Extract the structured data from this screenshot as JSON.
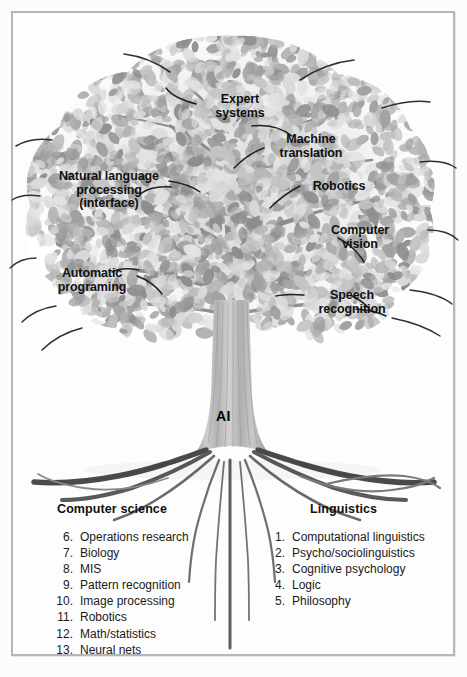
{
  "figure": {
    "title_root": "AI",
    "canopy_labels": [
      {
        "id": "expert-systems",
        "text": "Expert\nsystems",
        "x": 196,
        "y": 93,
        "w": 88,
        "align": "center"
      },
      {
        "id": "machine-translation",
        "text": "Machine\ntranslation",
        "x": 262,
        "y": 133,
        "w": 98,
        "align": "center"
      },
      {
        "id": "natural-language",
        "text": "Natural language\nprocessing\n(interface)",
        "x": 50,
        "y": 170,
        "w": 118,
        "align": "center"
      },
      {
        "id": "robotics",
        "text": "Robotics",
        "x": 306,
        "y": 180,
        "w": 66,
        "align": "center"
      },
      {
        "id": "computer-vision",
        "text": "Computer\nvision",
        "x": 322,
        "y": 224,
        "w": 76,
        "align": "center"
      },
      {
        "id": "automatic-programing",
        "text": "Automatic\nprograming",
        "x": 48,
        "y": 267,
        "w": 88,
        "align": "center"
      },
      {
        "id": "speech-recognition",
        "text": "Speech\nrecognition",
        "x": 310,
        "y": 289,
        "w": 84,
        "align": "center"
      }
    ],
    "columns": [
      {
        "id": "computer-science",
        "heading": "Computer science",
        "heading_x": 57,
        "heading_y": 502,
        "list_x": 52,
        "list_y": 529,
        "items": [
          {
            "num": "6.",
            "label": "Operations research"
          },
          {
            "num": "7.",
            "label": "Biology"
          },
          {
            "num": "8.",
            "label": "MIS"
          },
          {
            "num": "9.",
            "label": "Pattern recognition"
          },
          {
            "num": "10.",
            "label": "Image processing"
          },
          {
            "num": "11.",
            "label": "Robotics"
          },
          {
            "num": "12.",
            "label": "Math/statistics"
          },
          {
            "num": "13.",
            "label": "Neural nets"
          }
        ]
      },
      {
        "id": "linguistics",
        "heading": "Linguistics",
        "heading_x": 310,
        "heading_y": 502,
        "list_x": 264,
        "list_y": 529,
        "items": [
          {
            "num": "1.",
            "label": "Computational linguistics"
          },
          {
            "num": "2.",
            "label": "Psycho/sociolinguistics"
          },
          {
            "num": "3.",
            "label": "Cognitive psychology"
          },
          {
            "num": "4.",
            "label": "Logic"
          },
          {
            "num": "5.",
            "label": "Philosophy"
          }
        ]
      }
    ],
    "colors": {
      "page_background": "#fdfdfd",
      "frame_border": "#b6b6b6",
      "leaf_light": "#d9d9d9",
      "leaf_mid": "#b4b4b4",
      "leaf_dark": "#8d8d8d",
      "branch": "#3a3a3a",
      "trunk_light": "#c9c9c9",
      "trunk_mid": "#a8a8a8",
      "root_dark": "#4a4a4a",
      "text": "#101010"
    }
  }
}
